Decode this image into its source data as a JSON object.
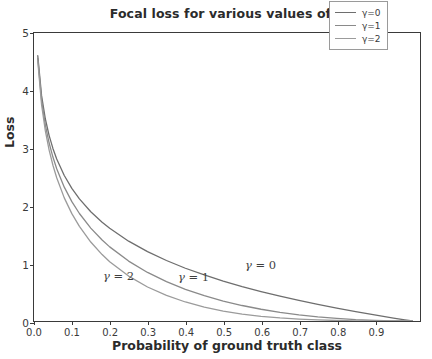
{
  "chart_data": {
    "type": "line",
    "title": "Focal loss for various values of γ",
    "xlabel": "Probability of ground truth class",
    "ylabel": "Loss",
    "xlim": [
      0.0,
      1.02
    ],
    "ylim": [
      0.0,
      5.0
    ],
    "grid": false,
    "legend_position": "upper right",
    "xticks": [
      "0.0",
      "0.1",
      "0.2",
      "0.3",
      "0.4",
      "0.5",
      "0.6",
      "0.7",
      "0.8",
      "0.9"
    ],
    "xtick_values": [
      0.0,
      0.1,
      0.2,
      0.3,
      0.4,
      0.5,
      0.6,
      0.7,
      0.8,
      0.9
    ],
    "yticks": [
      "0",
      "1",
      "2",
      "3",
      "4",
      "5"
    ],
    "ytick_values": [
      0,
      1,
      2,
      3,
      4,
      5
    ],
    "x": [
      0.01,
      0.02,
      0.03,
      0.04,
      0.05,
      0.06,
      0.08,
      0.1,
      0.12,
      0.15,
      0.18,
      0.2,
      0.25,
      0.3,
      0.35,
      0.4,
      0.45,
      0.5,
      0.55,
      0.6,
      0.65,
      0.7,
      0.75,
      0.8,
      0.85,
      0.9,
      0.95,
      0.98,
      1.0
    ],
    "series": [
      {
        "name": "γ=0",
        "gamma": 0,
        "color": "#6e6e6e",
        "formula": "-log(p)",
        "values": [
          4.605,
          3.912,
          3.507,
          3.219,
          2.996,
          2.813,
          2.526,
          2.303,
          2.12,
          1.897,
          1.715,
          1.609,
          1.386,
          1.204,
          1.05,
          0.916,
          0.799,
          0.693,
          0.598,
          0.511,
          0.431,
          0.357,
          0.288,
          0.223,
          0.163,
          0.105,
          0.051,
          0.02,
          0.0
        ]
      },
      {
        "name": "γ=1",
        "gamma": 1,
        "color": "#8a8a8a",
        "formula": "-(1-p)*log(p)",
        "values": [
          4.559,
          3.834,
          3.402,
          3.09,
          2.846,
          2.644,
          2.324,
          2.072,
          1.866,
          1.613,
          1.406,
          1.287,
          1.04,
          0.843,
          0.683,
          0.549,
          0.439,
          0.347,
          0.269,
          0.204,
          0.151,
          0.107,
          0.072,
          0.045,
          0.024,
          0.011,
          0.003,
          0.0004,
          0.0
        ]
      },
      {
        "name": "γ=2",
        "gamma": 2,
        "color": "#9b9b9b",
        "formula": "-(1-p)^2*log(p)",
        "values": [
          4.513,
          3.757,
          3.3,
          2.966,
          2.704,
          2.486,
          2.138,
          1.864,
          1.643,
          1.371,
          1.153,
          1.03,
          0.78,
          0.59,
          0.444,
          0.33,
          0.242,
          0.173,
          0.121,
          0.082,
          0.053,
          0.032,
          0.018,
          0.009,
          0.004,
          0.001,
          0.0001,
          0.0,
          0.0
        ]
      }
    ],
    "annotations": [
      {
        "id": "gamma-2",
        "text": "γ = 2",
        "var": "γ",
        "eq": " = ",
        "value": "2",
        "x_px": 103,
        "y_px": 269
      },
      {
        "id": "gamma-1",
        "text": "γ = 1",
        "var": "γ",
        "eq": " = ",
        "value": "1",
        "x_px": 178,
        "y_px": 270
      },
      {
        "id": "gamma-0",
        "text": "γ = 0",
        "var": "γ",
        "eq": " = ",
        "value": "0",
        "x_px": 245,
        "y_px": 258
      }
    ],
    "legend": [
      {
        "label": "γ=0",
        "color": "#6e6e6e"
      },
      {
        "label": "γ=1",
        "color": "#8a8a8a"
      },
      {
        "label": "γ=2",
        "color": "#9b9b9b"
      }
    ]
  }
}
